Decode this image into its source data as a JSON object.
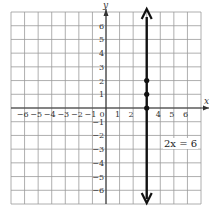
{
  "chart_data": {
    "type": "line",
    "title": "",
    "xlabel": "x",
    "ylabel": "y",
    "xlim": [
      -7,
      7
    ],
    "ylim": [
      -7,
      7
    ],
    "grid": true,
    "x_tick_labels": [
      "-6",
      "-5",
      "-4",
      "-3",
      "-2",
      "-1",
      "0",
      "1",
      "2",
      "4",
      "5",
      "6"
    ],
    "y_tick_labels": [
      "6",
      "5",
      "4",
      "3",
      "2",
      "1",
      "-1",
      "-2",
      "-3",
      "-4",
      "-5",
      "-6"
    ],
    "series": [
      {
        "name": "2x = 6",
        "kind": "vertical-line",
        "x": 3,
        "points": [
          {
            "x": 3,
            "y": 0
          },
          {
            "x": 3,
            "y": 1
          },
          {
            "x": 3,
            "y": 2
          }
        ],
        "arrows": "both"
      }
    ],
    "annotations": [
      {
        "text": "2x = 6",
        "x": 5,
        "y": -2.5
      }
    ]
  },
  "labels": {
    "x_axis": "x",
    "y_axis": "y",
    "equation": "2x = 6"
  }
}
